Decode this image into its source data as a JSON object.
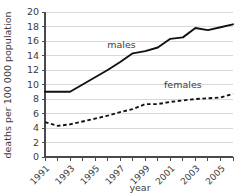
{
  "chart_data": {
    "type": "line",
    "title": "",
    "xlabel": "year",
    "ylabel": "deaths per 100 000 population",
    "x": [
      1991,
      1992,
      1993,
      1994,
      1995,
      1996,
      1997,
      1998,
      1999,
      2000,
      2001,
      2002,
      2003,
      2004,
      2005,
      2006
    ],
    "xlim": [
      1991,
      2006
    ],
    "ylim": [
      0,
      20
    ],
    "yticks": [
      0,
      2,
      4,
      6,
      8,
      10,
      12,
      14,
      16,
      18,
      20
    ],
    "ytick_labels": [
      "0",
      "2",
      "4",
      "6",
      "8",
      "10",
      "12",
      "14",
      "16",
      "18",
      "20"
    ],
    "xticks": [
      1991,
      1993,
      1995,
      1997,
      1999,
      2001,
      2003,
      2005
    ],
    "xtick_labels": [
      "1991",
      "1993",
      "1995",
      "1997",
      "1999",
      "2001",
      "2003",
      "2005"
    ],
    "grid": "horizontal",
    "legend_position": "inline-annotation",
    "series": [
      {
        "name": "males",
        "style": "solid",
        "color": "#111111",
        "label_x": 1997.1,
        "label_y": 15.1,
        "values": [
          9.0,
          9.0,
          9.0,
          10.0,
          11.0,
          12.0,
          13.1,
          14.3,
          14.6,
          15.1,
          16.3,
          16.5,
          17.8,
          17.5,
          17.9,
          18.3
        ]
      },
      {
        "name": "females",
        "style": "dashed",
        "color": "#111111",
        "label_x": 2002.0,
        "label_y": 9.5,
        "values": [
          4.8,
          4.3,
          4.5,
          4.9,
          5.3,
          5.7,
          6.2,
          6.6,
          7.3,
          7.3,
          7.6,
          7.8,
          8.0,
          8.1,
          8.2,
          8.7
        ]
      }
    ]
  }
}
